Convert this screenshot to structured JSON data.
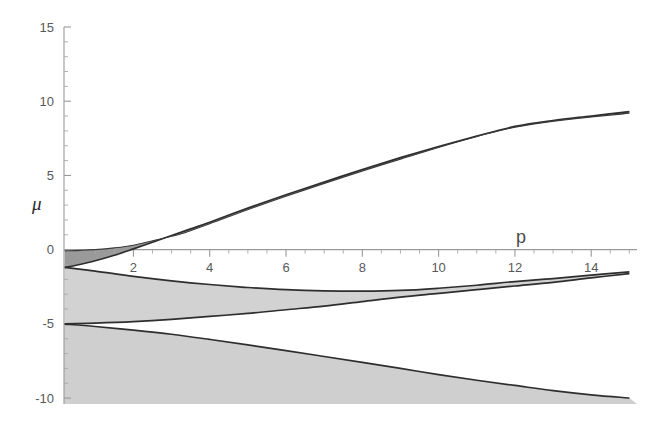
{
  "figure": {
    "background_color": "#ffffff",
    "plot_area": {
      "left": 64,
      "right": 637,
      "top": 27,
      "bottom": 404
    }
  },
  "chart_data": {
    "type": "line",
    "title": "",
    "subtitle": "",
    "xlabel": "p",
    "ylabel": "μ",
    "xlim": [
      0.18,
      15.2
    ],
    "ylim": [
      -10.4,
      15.0
    ],
    "grid": false,
    "legend": null,
    "legend_position": "none",
    "x_ticks_major": [
      2,
      4,
      6,
      8,
      10,
      12,
      14
    ],
    "x_tick_labels": [
      "2",
      "4",
      "6",
      "8",
      "10",
      "12",
      "14"
    ],
    "x_ticks_minor": [
      1,
      1.5,
      2.5,
      3,
      3.5,
      4.5,
      5,
      5.5,
      6.5,
      7,
      7.5,
      8.5,
      9,
      9.5,
      10.5,
      11,
      11.5,
      12.5,
      13,
      13.5,
      14.5,
      15
    ],
    "y_ticks_major": [
      15,
      10,
      5,
      0,
      -5,
      -10
    ],
    "y_tick_labels": [
      "15",
      "10",
      "5",
      "0",
      "-5",
      "-10"
    ],
    "y_ticks_minor": [
      14,
      13,
      12,
      11,
      9,
      8,
      7,
      6,
      4,
      3,
      2,
      1,
      -1,
      -2,
      -3,
      -4,
      -6,
      -7,
      -8,
      -9
    ],
    "axis_colors": {
      "axis_line": "#9a9a9a",
      "tick_label": "#58595b",
      "curve": "#2e2e2e"
    },
    "shaded_regions": [
      {
        "name": "dark-upper-wedge",
        "color": "#9a9a9a",
        "description": "Narrow dark wedge between mu=0 and the rising upper boundary curve, from p=0.2 to about p=3.3 where it pinches closed."
      },
      {
        "name": "light-middle-region",
        "color": "#d2d2d2",
        "description": "Light gray band bounded above by the descending curve from (0.2,-1.2) and below by the horizontal line at mu=-5, closing near p=13."
      },
      {
        "name": "light-lower-region",
        "color": "#cfcfcf",
        "description": "Light gray region below mu=-5 bounded by the descending curve reaching mu=-10 at the right edge."
      }
    ],
    "series": [
      {
        "name": "upper-boundary-curve",
        "description": "Rising curve from (0.2, -1.2) to (15, 9.3), concave, approximately mu = -1.2 + 2.9*(p^0.78 - 0.28)",
        "x": [
          0.2,
          0.5,
          1.0,
          1.5,
          2.0,
          2.5,
          3.0,
          3.5,
          4.0,
          5.0,
          6.0,
          7.0,
          8.0,
          9.0,
          10.0,
          11.0,
          12.0,
          13.0,
          14.0,
          15.0
        ],
        "y": [
          -1.2,
          -1.05,
          -0.75,
          -0.38,
          0.05,
          0.5,
          0.95,
          1.4,
          1.85,
          2.8,
          3.7,
          4.55,
          5.4,
          6.2,
          6.95,
          7.65,
          8.3,
          8.7,
          9.0,
          9.3
        ]
      },
      {
        "name": "upper-inner-curve",
        "description": "Second nearly-coincident curve forming the upper side of the dark wedge, from (0.2, -0.1) merging into the upper boundary near p=3.3",
        "x": [
          0.2,
          0.6,
          1.0,
          1.5,
          2.0,
          2.5,
          3.0,
          3.3,
          4.0,
          6.0,
          9.0,
          12.0,
          15.0
        ],
        "y": [
          -0.08,
          -0.05,
          0.0,
          0.12,
          0.3,
          0.6,
          0.9,
          1.1,
          1.75,
          3.6,
          6.1,
          8.25,
          9.2
        ]
      },
      {
        "name": "middle-descending-curve",
        "description": "Curve descending from (0.2, -1.2) to a minimum near (9, -2.6) then rising to (15, -1.5) at the right edge",
        "x": [
          0.2,
          1.0,
          2.0,
          3.0,
          4.0,
          5.0,
          6.0,
          7.0,
          8.0,
          9.0,
          10.0,
          11.0,
          12.0,
          13.0,
          14.0,
          15.0
        ],
        "y": [
          -1.2,
          -1.45,
          -1.8,
          -2.1,
          -2.35,
          -2.55,
          -2.7,
          -2.78,
          -2.8,
          -2.75,
          -2.6,
          -2.4,
          -2.15,
          -1.95,
          -1.72,
          -1.5
        ]
      },
      {
        "name": "lower-rising-curve",
        "description": "Curve starting at (0.2, -5.0) rising slowly, merging with the middle descending curve near p=13.5 at the right edge",
        "x": [
          0.2,
          1.0,
          2.0,
          3.0,
          4.0,
          5.0,
          6.0,
          7.0,
          8.0,
          9.0,
          10.0,
          11.0,
          12.0,
          13.0,
          14.0,
          15.0
        ],
        "y": [
          -5.0,
          -4.95,
          -4.85,
          -4.7,
          -4.5,
          -4.3,
          -4.05,
          -3.8,
          -3.5,
          -3.2,
          -2.95,
          -2.7,
          -2.45,
          -2.2,
          -1.9,
          -1.62
        ]
      },
      {
        "name": "lower-descending-curve",
        "description": "Curve starting at (0.2, -5.0) descending steadily to (15, -10.0) at the bottom right corner",
        "x": [
          0.2,
          1.0,
          2.0,
          3.0,
          4.0,
          5.0,
          6.0,
          7.0,
          8.0,
          9.0,
          10.0,
          11.0,
          12.0,
          13.0,
          14.0,
          15.0
        ],
        "y": [
          -5.02,
          -5.18,
          -5.42,
          -5.7,
          -6.05,
          -6.42,
          -6.8,
          -7.2,
          -7.6,
          -8.0,
          -8.42,
          -8.8,
          -9.15,
          -9.5,
          -9.78,
          -10.0
        ]
      }
    ]
  }
}
